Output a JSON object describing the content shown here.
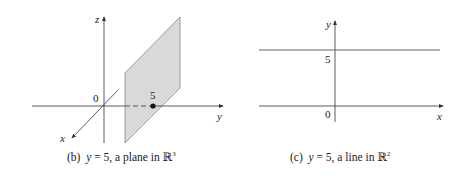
{
  "figure_b": {
    "caption_prefix": "(b)",
    "caption_var": "y",
    "caption_eq": "= 5, a plane in",
    "caption_space": "ℝ",
    "caption_exp": "3",
    "axis_z": "z",
    "axis_y": "y",
    "axis_x": "x",
    "origin": "0",
    "point_label": "5",
    "colors": {
      "plane_fill": "#d9d9d9",
      "plane_stroke": "#555555",
      "axis": "#333333"
    }
  },
  "figure_c": {
    "caption_prefix": "(c)",
    "caption_var": "y",
    "caption_eq": "= 5, a line in",
    "caption_space": "ℝ",
    "caption_exp": "2",
    "axis_y": "y",
    "axis_x": "x",
    "origin": "0",
    "tick_label": "5",
    "colors": {
      "line": "#555555",
      "axis": "#333333"
    }
  }
}
